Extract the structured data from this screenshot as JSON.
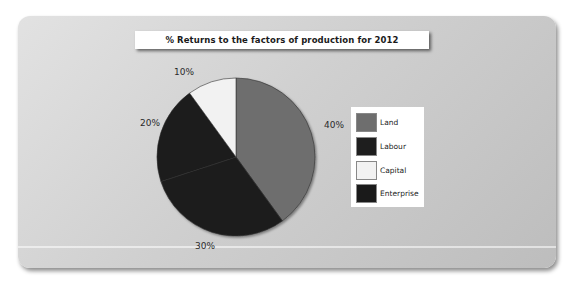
{
  "chart_data": {
    "type": "pie",
    "title": "% Returns to the factors of production for 2012",
    "categories": [
      "Land",
      "Labour",
      "Capital",
      "Enterprise"
    ],
    "values": [
      40,
      30,
      10,
      20
    ],
    "slice_order_clockwise_from_top": [
      "Land",
      "Labour",
      "Enterprise",
      "Capital"
    ],
    "slice_values_clockwise_from_top": [
      40,
      30,
      20,
      10
    ],
    "data_labels": [
      "40%",
      "30%",
      "20%",
      "10%"
    ],
    "colors": {
      "Land": "#6e6e6e",
      "Labour": "#1e1e1e",
      "Capital": "#f2f2f2",
      "Enterprise": "#1a1a1a"
    },
    "legend_position": "right",
    "xlabel": "",
    "ylabel": ""
  },
  "title": "% Returns to the factors of production for 2012",
  "labels": {
    "land": "40%",
    "labour": "30%",
    "enterprise": "20%",
    "capital": "10%"
  },
  "legend": {
    "items": [
      {
        "label": "Land",
        "color": "#6e6e6e"
      },
      {
        "label": "Labour",
        "color": "#1e1e1e"
      },
      {
        "label": "Capital",
        "color": "#f2f2f2"
      },
      {
        "label": "Enterprise",
        "color": "#1a1a1a"
      }
    ]
  }
}
